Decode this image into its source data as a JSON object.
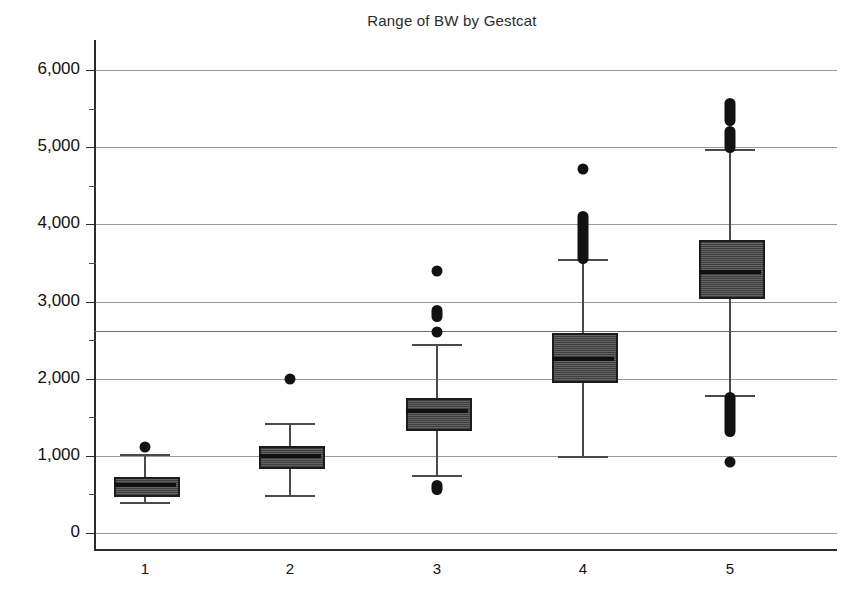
{
  "chart_data": {
    "type": "box",
    "title": "Range of BW by Gestcat",
    "xlabel": "",
    "ylabel": "",
    "ylim": [
      0,
      6400
    ],
    "yticks": [
      0,
      1000,
      2000,
      3000,
      4000,
      5000,
      6000
    ],
    "ytick_labels": [
      "0",
      "1,000",
      "2,000",
      "3,000",
      "4,000",
      "5,000",
      "6,000"
    ],
    "minor_tick_interval": 500,
    "grid": true,
    "extra_reference_line": 2620,
    "categories": [
      "1",
      "2",
      "3",
      "4",
      "5"
    ],
    "boxes": [
      {
        "category": "1",
        "whisker_low": 400,
        "q1": 520,
        "median": 620,
        "q3": 730,
        "whisker_high": 1020,
        "outliers": [
          1110
        ]
      },
      {
        "category": "2",
        "whisker_low": 490,
        "q1": 880,
        "median": 1000,
        "q3": 1130,
        "whisker_high": 1430,
        "outliers": [
          2000
        ]
      },
      {
        "category": "3",
        "whisker_low": 750,
        "q1": 1370,
        "median": 1580,
        "q3": 1750,
        "whisker_high": 2450,
        "outliers": [
          3400,
          2880,
          2800,
          2600,
          620,
          560
        ]
      },
      {
        "category": "4",
        "whisker_low": 1000,
        "q1": 2000,
        "median": 2250,
        "q3": 2590,
        "whisker_high": 3550,
        "outliers": [
          4720,
          4100,
          4020,
          3960,
          3900,
          3840,
          3780,
          3720,
          3660,
          3600,
          3560
        ]
      },
      {
        "category": "5",
        "whisker_low": 1790,
        "q1": 3080,
        "median": 3380,
        "q3": 3800,
        "whisker_high": 4970,
        "outliers": [
          5570,
          5500,
          5430,
          5350,
          5200,
          5120,
          5050,
          4990,
          1760,
          1700,
          1620,
          1540,
          1460,
          1380,
          1310,
          920
        ]
      }
    ]
  },
  "axis": {
    "y_axis_name": "y-axis",
    "x_axis_name": "x-axis"
  }
}
